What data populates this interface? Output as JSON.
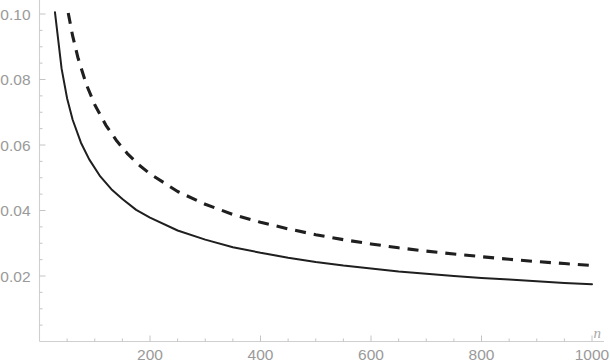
{
  "chart_data": {
    "type": "line",
    "title": "",
    "subtitle": "",
    "xlabel": "n",
    "ylabel": "",
    "xlim": [
      0,
      1020
    ],
    "ylim": [
      0,
      0.105
    ],
    "grid": false,
    "legend": null,
    "legend_position": "none",
    "x_ticks": [
      200,
      400,
      600,
      800,
      1000
    ],
    "x_tick_labels": [
      "200",
      "400",
      "600",
      "800",
      "1000"
    ],
    "x_minor_tick_step": 50,
    "y_ticks": [
      0.02,
      0.04,
      0.06,
      0.08,
      0.1
    ],
    "y_tick_labels": [
      "0.02",
      "0.04",
      "0.06",
      "0.08",
      "0.10"
    ],
    "y_minor_tick_step": 0.005,
    "series": [
      {
        "name": "solid-curve",
        "style": "solid",
        "color": "#1f1f1f",
        "x": [
          28,
          40,
          50,
          60,
          75,
          90,
          110,
          130,
          150,
          175,
          200,
          250,
          300,
          350,
          400,
          450,
          500,
          550,
          600,
          650,
          700,
          750,
          800,
          850,
          900,
          950,
          1000
        ],
        "y": [
          0.1005,
          0.0833,
          0.0742,
          0.0677,
          0.0607,
          0.0556,
          0.0504,
          0.0465,
          0.0435,
          0.0402,
          0.0378,
          0.0339,
          0.0311,
          0.0288,
          0.0271,
          0.0256,
          0.0243,
          0.0232,
          0.0223,
          0.0214,
          0.0207,
          0.02,
          0.0194,
          0.0189,
          0.0184,
          0.0179,
          0.0175
        ]
      },
      {
        "name": "dashed-curve",
        "style": "dashed",
        "color": "#1f1f1f",
        "x": [
          52,
          60,
          70,
          85,
          100,
          120,
          140,
          160,
          180,
          200,
          250,
          300,
          350,
          400,
          450,
          500,
          550,
          600,
          650,
          700,
          750,
          800,
          850,
          900,
          950,
          1000
        ],
        "y": [
          0.1003,
          0.0933,
          0.0864,
          0.0784,
          0.0723,
          0.0661,
          0.0612,
          0.0572,
          0.0539,
          0.0512,
          0.0458,
          0.0419,
          0.0388,
          0.0364,
          0.0344,
          0.0326,
          0.0311,
          0.0298,
          0.0286,
          0.0276,
          0.0267,
          0.0259,
          0.0251,
          0.0244,
          0.0238,
          0.0232
        ]
      }
    ],
    "annotations": []
  },
  "axes": {
    "x_axis_name": "n",
    "axis_color": "#cfcfcf",
    "tick_color": "#c4c4c4",
    "label_color": "#9a9a9a"
  }
}
